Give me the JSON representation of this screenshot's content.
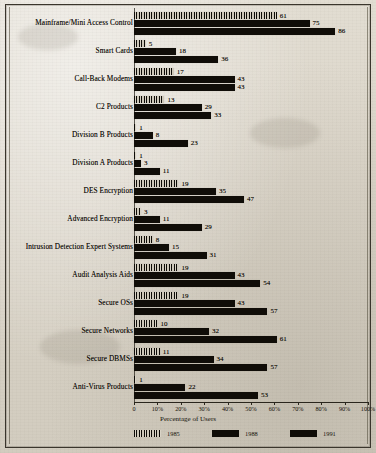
{
  "figure": {
    "xlabel": "Percentage of Users"
  },
  "chart_data": {
    "type": "bar",
    "orientation": "horizontal",
    "title": "",
    "xlabel": "Percentage of Users",
    "ylabel": "",
    "xlim": [
      0,
      100
    ],
    "xticks": [
      "0",
      "10%",
      "20%",
      "30%",
      "40%",
      "50%",
      "60%",
      "70%",
      "80%",
      "90%",
      "100%"
    ],
    "xtick_values": [
      0,
      10,
      20,
      30,
      40,
      50,
      60,
      70,
      80,
      90,
      100
    ],
    "grid": false,
    "legend_position": "bottom",
    "categories": [
      "Mainframe/Mini Access Control",
      "Smart Cards",
      "Call-Back Modems",
      "C2 Products",
      "Division B Products",
      "Division A Products",
      "DES Encryption",
      "Advanced Encryption",
      "Intrusion Detection Expert Systems",
      "Audit Analysis Aids",
      "Secure OSs",
      "Secure Networks",
      "Secure DBMSs",
      "Anti-Virus Products"
    ],
    "series": [
      {
        "name": "1985",
        "swatch": "hatched",
        "values": [
          61,
          5,
          17,
          13,
          1,
          1,
          19,
          3,
          8,
          19,
          19,
          10,
          11,
          1
        ]
      },
      {
        "name": "1988",
        "swatch": "solid",
        "values": [
          75,
          18,
          43,
          29,
          8,
          3,
          35,
          11,
          15,
          43,
          43,
          32,
          34,
          22
        ]
      },
      {
        "name": "1991",
        "swatch": "solid",
        "values": [
          86,
          36,
          43,
          33,
          23,
          11,
          47,
          29,
          31,
          54,
          57,
          61,
          57,
          53
        ]
      }
    ]
  }
}
